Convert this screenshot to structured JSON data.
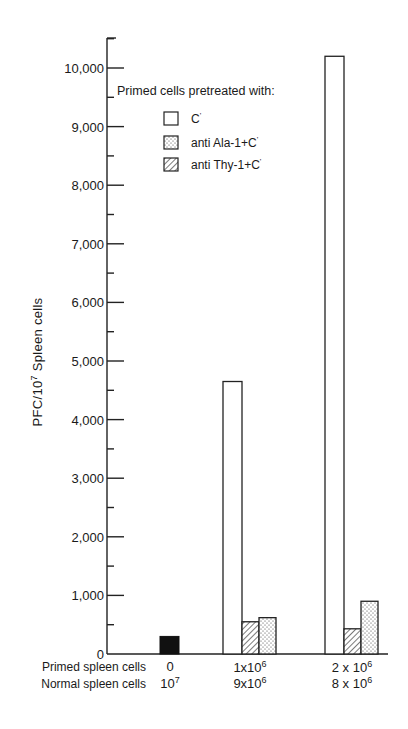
{
  "chart_data": {
    "type": "bar",
    "title": "",
    "ylabel": "PFC/10^7 Spleen cells",
    "ylabel_parts": {
      "pre": "PFC/10",
      "sup": "7",
      "post": " Spleen cells"
    },
    "ylim": [
      0,
      10500
    ],
    "yticks": [
      0,
      1000,
      2000,
      3000,
      4000,
      5000,
      6000,
      7000,
      8000,
      9000,
      10000
    ],
    "ytick_labels": [
      "0",
      "1,000",
      "2,000",
      "3,000",
      "4,000",
      "5,000",
      "6,000",
      "7,000",
      "8,000",
      "9,000",
      "10,000"
    ],
    "grid": false,
    "legend": {
      "title": "Primed cells pretreated with:",
      "position": "upper-center",
      "entries": [
        {
          "name": "C'",
          "pattern": "open"
        },
        {
          "name": "anti Ala-1+C'",
          "pattern": "dotted"
        },
        {
          "name": "anti Thy-1+C'",
          "pattern": "hatched"
        }
      ]
    },
    "x_rows": [
      {
        "label": "Primed spleen cells",
        "values": [
          "0",
          "1x10^6",
          "2x10^6"
        ]
      },
      {
        "label": "Normal spleen cells",
        "values": [
          "10^7",
          "9x10^6",
          "8x10^6"
        ]
      }
    ],
    "categories": [
      "0 / 10^7",
      "1x10^6 / 9x10^6",
      "2x10^6 / 8x10^6"
    ],
    "control": {
      "name": "Normal spleen cells only (control)",
      "pattern": "solid-black",
      "category": 0,
      "value": 300
    },
    "series": [
      {
        "name": "C'",
        "pattern": "open",
        "values": [
          null,
          4650,
          10200
        ]
      },
      {
        "name": "anti Thy-1+C'",
        "pattern": "hatched",
        "values": [
          null,
          550,
          430
        ]
      },
      {
        "name": "anti Ala-1+C'",
        "pattern": "dotted",
        "values": [
          null,
          620,
          900
        ]
      }
    ]
  },
  "labels": {
    "legend_title": "Primed cells pretreated with:",
    "legend_1": "C",
    "legend_2": "anti Ala-1+C",
    "legend_3": "anti Thy-1+C",
    "row1": "Primed spleen cells",
    "row2": "Normal spleen cells",
    "ylabel_pre": "PFC/10",
    "ylabel_sup": "7",
    "ylabel_post": " Spleen cells",
    "c1_r1": "0",
    "c1_r2_base": "10",
    "c1_r2_sup": "7",
    "c2_r1_base": "1x10",
    "c2_r1_sup": "6",
    "c2_r2_base": "9x10",
    "c2_r2_sup": "6",
    "c3_r1_base": "2 x 10",
    "c3_r1_sup": "6",
    "c3_r2_base": "8 x 10",
    "c3_r2_sup": "6"
  }
}
